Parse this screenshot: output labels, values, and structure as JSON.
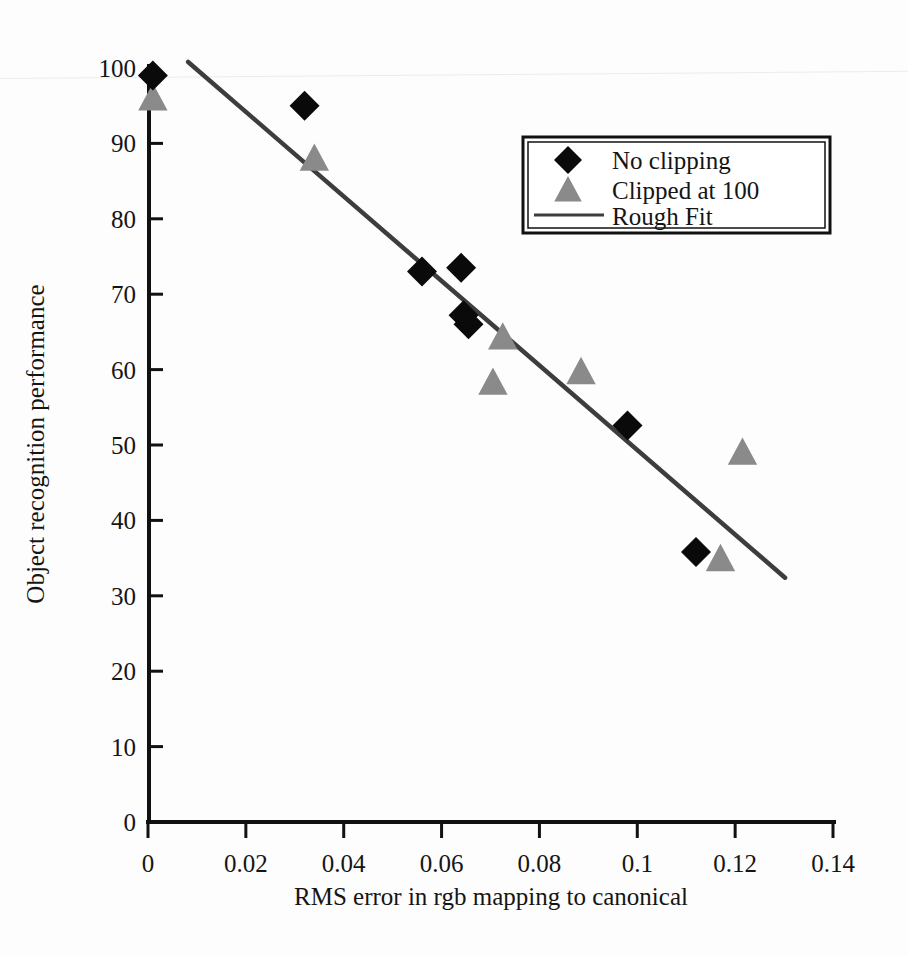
{
  "chart_data": {
    "type": "scatter",
    "title": "",
    "xlabel": "RMS  error  in rgb mapping to canonical",
    "ylabel": "Object recognition performance",
    "xlim": [
      0,
      0.14
    ],
    "ylim": [
      0,
      100
    ],
    "xticks": [
      "0",
      "0.02",
      "0.04",
      "0.06",
      "0.08",
      "0.1",
      "0.12",
      "0.14"
    ],
    "xtick_values": [
      0,
      0.02,
      0.04,
      0.06,
      0.08,
      0.1,
      0.12,
      0.14
    ],
    "yticks": [
      "0",
      "10",
      "20",
      "30",
      "40",
      "50",
      "60",
      "70",
      "80",
      "90",
      "100"
    ],
    "ytick_values": [
      0,
      10,
      20,
      30,
      40,
      50,
      60,
      70,
      80,
      90,
      100
    ],
    "grid": false,
    "legend_position": "upper right",
    "series": [
      {
        "name": "No clipping",
        "marker": "diamond",
        "color": "#0a0a0a",
        "points": [
          {
            "x": 0.001,
            "y": 99.0
          },
          {
            "x": 0.032,
            "y": 95.0
          },
          {
            "x": 0.056,
            "y": 73.0
          },
          {
            "x": 0.064,
            "y": 73.5
          },
          {
            "x": 0.0645,
            "y": 67.2
          },
          {
            "x": 0.0655,
            "y": 66.0
          },
          {
            "x": 0.098,
            "y": 52.6
          },
          {
            "x": 0.112,
            "y": 35.8
          }
        ]
      },
      {
        "name": "Clipped at  100",
        "marker": "triangle",
        "color": "#8a8a8a",
        "points": [
          {
            "x": 0.001,
            "y": 96.0
          },
          {
            "x": 0.034,
            "y": 88.0
          },
          {
            "x": 0.0705,
            "y": 58.3
          },
          {
            "x": 0.0725,
            "y": 64.3
          },
          {
            "x": 0.0885,
            "y": 59.7
          },
          {
            "x": 0.1215,
            "y": 49.0
          },
          {
            "x": 0.117,
            "y": 34.9
          }
        ]
      },
      {
        "name": "Rough Fit",
        "marker": "line",
        "color": "#3d3d3d",
        "endpoints": [
          {
            "x": 0.0082,
            "y": 100.8
          },
          {
            "x": 0.1302,
            "y": 32.4
          }
        ]
      }
    ]
  },
  "legend": {
    "entries": [
      {
        "label": "No clipping",
        "marker": "diamond"
      },
      {
        "label": "Clipped at  100",
        "marker": "triangle"
      },
      {
        "label": "Rough Fit",
        "marker": "line"
      }
    ]
  }
}
